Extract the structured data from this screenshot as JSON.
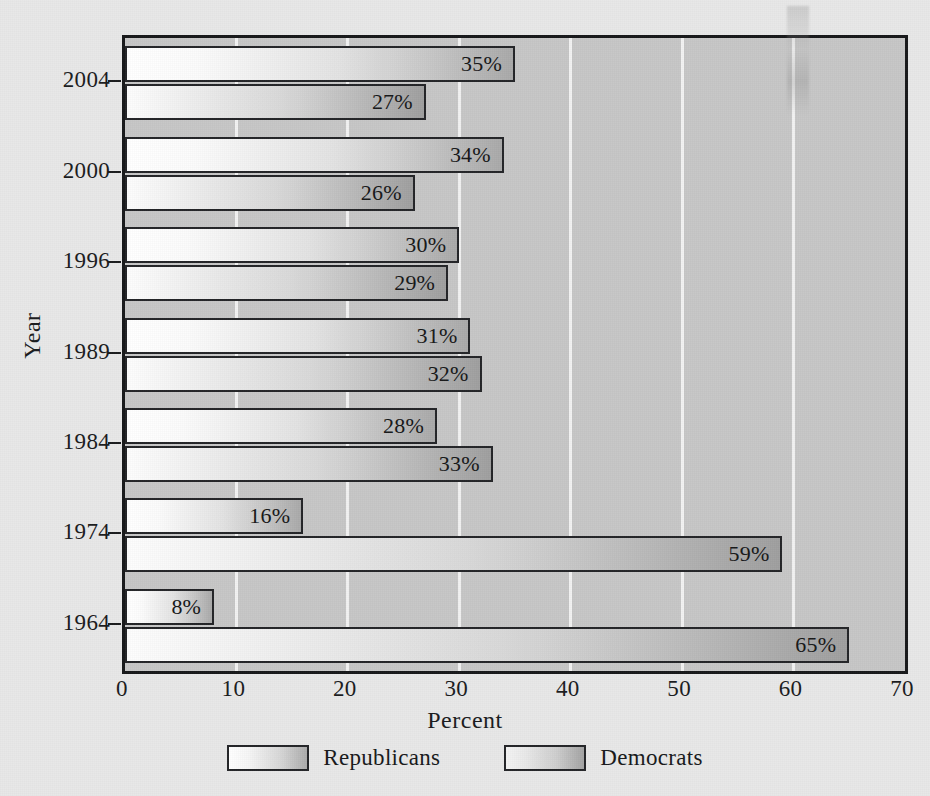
{
  "chart_data": {
    "type": "bar",
    "orientation": "horizontal",
    "title": "",
    "xlabel": "Percent",
    "ylabel": "Year",
    "xlim": [
      0,
      70
    ],
    "ylim": null,
    "xticks": [
      "0",
      "10",
      "20",
      "30",
      "40",
      "50",
      "60",
      "70"
    ],
    "xtick_values": [
      0,
      10,
      20,
      30,
      40,
      50,
      60,
      70
    ],
    "grid": "vertical-white-gridlines",
    "legend_position": "bottom-center",
    "categories": [
      "2004",
      "2000",
      "1996",
      "1989",
      "1984",
      "1974",
      "1964"
    ],
    "series": [
      {
        "name": "Republicans",
        "values": [
          35,
          34,
          30,
          31,
          28,
          16,
          8
        ],
        "labels": [
          "35%",
          "34%",
          "30%",
          "31%",
          "28%",
          "16%",
          "8%"
        ]
      },
      {
        "name": "Democrats",
        "values": [
          27,
          26,
          29,
          32,
          33,
          59,
          65
        ],
        "labels": [
          "27%",
          "26%",
          "29%",
          "32%",
          "33%",
          "59%",
          "65%"
        ]
      }
    ],
    "colors": {
      "plot_background": "#c6c6c6",
      "page_background": "#e8e8e8",
      "gridline": "#f2f2f2",
      "axis_line": "#17181a",
      "republicans_gradient_start": "#ffffff",
      "republicans_gradient_end": "#a9a9a9",
      "democrats_gradient_start": "#fdfdfd",
      "democrats_gradient_end": "#9f9f9f",
      "text": "#1a1b1d"
    }
  },
  "legend": {
    "items": [
      {
        "label": "Republicans",
        "swatch": "rep"
      },
      {
        "label": "Democrats",
        "swatch": "dem"
      }
    ]
  }
}
